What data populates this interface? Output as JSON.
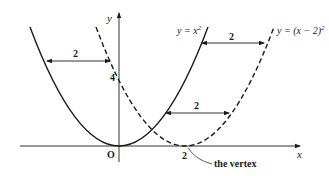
{
  "diagram": {
    "axes": {
      "x_label": "x",
      "y_label": "y",
      "origin_label": "O",
      "y_tick_label": "4",
      "x_tick_label": "2"
    },
    "curves": [
      {
        "name": "y = x^2",
        "label_prefix": "y = x",
        "label_sup": "2",
        "style": "solid"
      },
      {
        "name": "y = (x - 2)^2",
        "label_prefix": "y = (x − 2)",
        "label_sup": "2",
        "style": "dashed"
      }
    ],
    "distance_arrows": [
      {
        "label": "2",
        "position": "upper-left"
      },
      {
        "label": "2",
        "position": "upper-right"
      },
      {
        "label": "2",
        "position": "middle"
      }
    ],
    "annotation": "the vertex",
    "colors": {
      "ink": "#1a1a1a",
      "background": "#ffffff"
    }
  }
}
